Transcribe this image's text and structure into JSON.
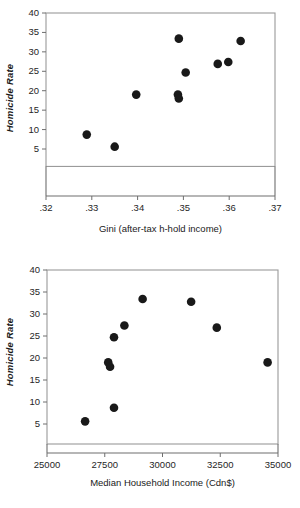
{
  "chart_data": [
    {
      "id": "gini",
      "type": "scatter",
      "title": "",
      "xlabel": "Gini (after-tax h-hold income)",
      "ylabel": "Homicide Rate",
      "xlim": [
        0.32,
        0.37
      ],
      "ylim": [
        0,
        40
      ],
      "grid": false,
      "legend": false,
      "xticks": [
        0.32,
        0.33,
        0.34,
        0.35,
        0.36,
        0.37
      ],
      "xtick_labels": [
        ".32",
        ".33",
        ".34",
        ".35",
        ".36",
        ".37"
      ],
      "yticks": [
        5,
        10,
        15,
        20,
        25,
        30,
        35,
        40
      ],
      "ytick_labels": [
        "5",
        "10",
        "15",
        "20",
        "25",
        "30",
        "35",
        "40"
      ],
      "marker": "filled-circle",
      "marker_color": "#191919",
      "points": [
        {
          "x": 0.3289,
          "y": 8.7
        },
        {
          "x": 0.335,
          "y": 5.6
        },
        {
          "x": 0.3397,
          "y": 19.0
        },
        {
          "x": 0.3488,
          "y": 19.0
        },
        {
          "x": 0.349,
          "y": 18.0
        },
        {
          "x": 0.349,
          "y": 33.4
        },
        {
          "x": 0.3505,
          "y": 24.7
        },
        {
          "x": 0.3575,
          "y": 26.9
        },
        {
          "x": 0.3598,
          "y": 27.4
        },
        {
          "x": 0.3625,
          "y": 32.8
        }
      ]
    },
    {
      "id": "income",
      "type": "scatter",
      "title": "",
      "xlabel": "Median Household Income (Cdn$)",
      "ylabel": "Homicide Rate",
      "xlim": [
        25000,
        35000
      ],
      "ylim": [
        0,
        40
      ],
      "grid": false,
      "legend": false,
      "xticks": [
        25000,
        27500,
        30000,
        32500,
        35000
      ],
      "xtick_labels": [
        "25000",
        "27500",
        "30000",
        "32500",
        "35000"
      ],
      "yticks": [
        5,
        10,
        15,
        20,
        25,
        30,
        35,
        40
      ],
      "ytick_labels": [
        "5",
        "10",
        "15",
        "20",
        "25",
        "30",
        "35",
        "40"
      ],
      "marker": "filled-circle",
      "marker_color": "#191919",
      "points": [
        {
          "x": 26650,
          "y": 5.6
        },
        {
          "x": 27650,
          "y": 19.0
        },
        {
          "x": 27730,
          "y": 18.0
        },
        {
          "x": 27900,
          "y": 8.7
        },
        {
          "x": 27900,
          "y": 24.7
        },
        {
          "x": 28350,
          "y": 27.4
        },
        {
          "x": 29140,
          "y": 33.4
        },
        {
          "x": 31240,
          "y": 32.8
        },
        {
          "x": 32350,
          "y": 26.9
        },
        {
          "x": 34550,
          "y": 19.0
        }
      ]
    }
  ],
  "colors": {
    "background": "#ffffff",
    "marker": "#191919",
    "frame": "#9a9a9a",
    "text": "#1a1a1a"
  }
}
